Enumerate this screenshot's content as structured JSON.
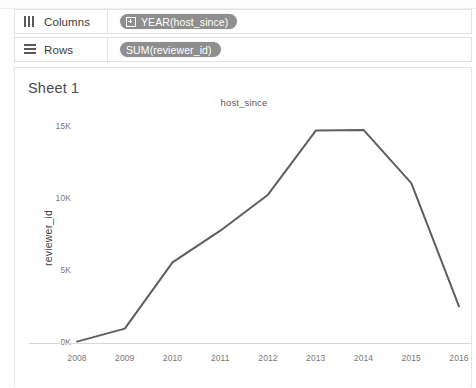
{
  "shelves": [
    {
      "name": "columns",
      "icon": "columns-icon",
      "label": "Columns",
      "pill": "YEAR(host_since)",
      "pill_icon": "expand-plus-icon"
    },
    {
      "name": "rows",
      "icon": "rows-icon",
      "label": "Rows",
      "pill": "SUM(reviewer_id)",
      "pill_icon": ""
    }
  ],
  "view": {
    "sheet_title": "Sheet 1"
  },
  "colors": {
    "pill_background": "#8e8e8e",
    "pill_text": "#ffffff",
    "line": "#5e5e5e",
    "axis_text": "#777777",
    "card_border": "#e6e6e6"
  },
  "chart_data": {
    "type": "line",
    "title": "host_since",
    "xlabel": "",
    "ylabel": "reviewer_id",
    "categories": [
      "2008",
      "2009",
      "2010",
      "2011",
      "2012",
      "2013",
      "2014",
      "2015",
      "2016"
    ],
    "x": [
      2008,
      2009,
      2010,
      2011,
      2012,
      2013,
      2014,
      2015,
      2016
    ],
    "values": [
      100,
      1000,
      5600,
      7800,
      10300,
      14750,
      14800,
      11100,
      2550
    ],
    "ytick_labels": [
      "0K",
      "5K",
      "10K",
      "15K"
    ],
    "ytick_values": [
      0,
      5000,
      10000,
      15000
    ],
    "ylim": [
      0,
      15500
    ],
    "xlim": [
      2008,
      2016
    ],
    "grid": false,
    "legend": "none",
    "series": [
      {
        "name": "SUM(reviewer_id)",
        "values": [
          100,
          1000,
          5600,
          7800,
          10300,
          14750,
          14800,
          11100,
          2550
        ]
      }
    ]
  }
}
